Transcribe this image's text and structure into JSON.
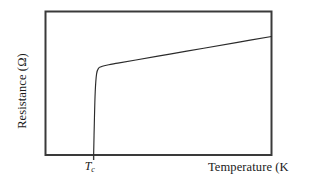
{
  "chart_data": {
    "type": "line",
    "title": "",
    "subtitle": "",
    "xlabel": "Temperature (K)",
    "ylabel": "Resistance (Ω)",
    "xlabel_display": "Temperature (K",
    "grid": false,
    "legend": null,
    "xlim": [
      0,
      100
    ],
    "ylim": [
      0,
      100
    ],
    "xticks": [],
    "yticks": [],
    "annotations": [
      {
        "name": "critical-temperature",
        "text": "T",
        "subscript": "c",
        "x": 21.3,
        "y": 0
      }
    ],
    "series": [
      {
        "name": "resistance-vs-temperature",
        "color": "#2b2b2b",
        "linewidth": 1,
        "x": [
          21.3,
          21.6,
          22.0,
          22.6,
          23.5,
          24.6,
          26.0,
          28.0,
          32.0,
          40.0,
          55.0,
          70.0,
          85.0,
          100.0
        ],
        "y": [
          0.0,
          22.0,
          44.0,
          56.5,
          60.5,
          61.5,
          62.2,
          62.9,
          64.0,
          66.2,
          70.3,
          74.4,
          78.5,
          82.6
        ]
      }
    ]
  },
  "frame": {
    "color": "#3a3a3a",
    "linewidth": 2,
    "background": "#ffffff"
  },
  "page": {
    "background": "#ffffff"
  }
}
